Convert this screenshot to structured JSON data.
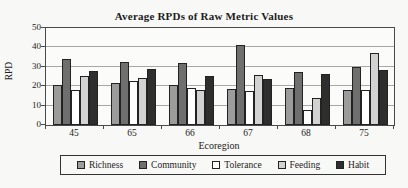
{
  "figure": {
    "background": "#f8f8f6",
    "axis_color": "#4a4a4a",
    "gridline_color": "#a8a8a8"
  },
  "chart_data": {
    "type": "bar",
    "title": "Average RPDs of Raw Metric Values",
    "xlabel": "Ecoregion",
    "ylabel": "RPD",
    "ylim": [
      0,
      50
    ],
    "yticks": [
      0,
      10,
      20,
      30,
      40,
      50
    ],
    "grid": true,
    "legend_position": "bottom",
    "categories": [
      "45",
      "65",
      "66",
      "67",
      "68",
      "75"
    ],
    "series": [
      {
        "name": "Richness",
        "color": "#9c9c9c",
        "values": [
          20.5,
          21.5,
          20.5,
          18.5,
          19,
          18
        ]
      },
      {
        "name": "Community",
        "color": "#6f6f6f",
        "values": [
          34,
          32.5,
          32,
          41,
          27.5,
          30
        ]
      },
      {
        "name": "Tolerance",
        "color": "#ffffff",
        "values": [
          18,
          22.5,
          19,
          17.5,
          7.5,
          18
        ]
      },
      {
        "name": "Feeding",
        "color": "#d2d2d2",
        "values": [
          25.5,
          24,
          18,
          26,
          14,
          37
        ]
      },
      {
        "name": "Habit",
        "color": "#2e2e2e",
        "values": [
          28,
          29,
          25.5,
          23.5,
          26.5,
          28.5
        ]
      }
    ]
  }
}
